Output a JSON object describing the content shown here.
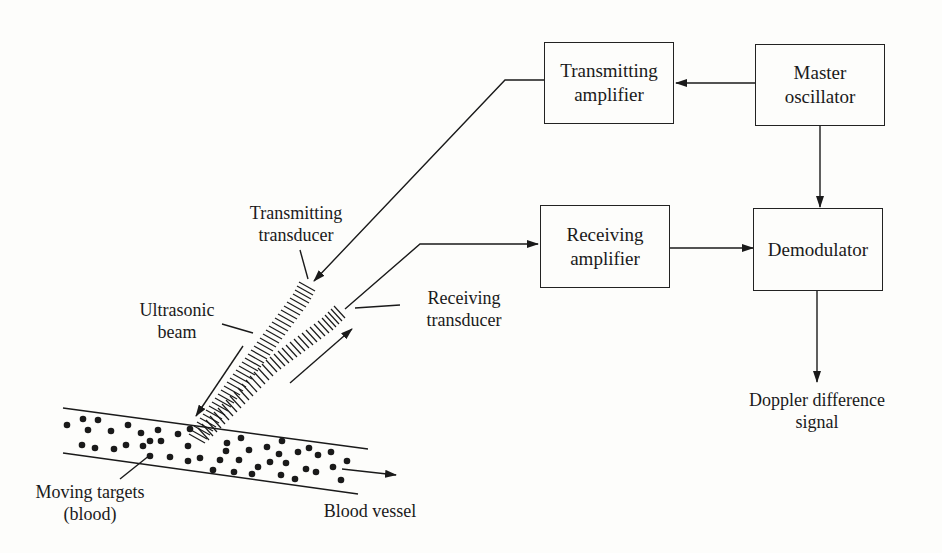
{
  "diagram": {
    "type": "block-diagram",
    "blocks": {
      "transmitting_amplifier": {
        "line1": "Transmitting",
        "line2": "amplifier"
      },
      "master_oscillator": {
        "line1": "Master",
        "line2": "oscillator"
      },
      "receiving_amplifier": {
        "line1": "Receiving",
        "line2": "amplifier"
      },
      "demodulator": {
        "line1": "Demodulator"
      }
    },
    "labels": {
      "transmitting_transducer": {
        "line1": "Transmitting",
        "line2": "transducer"
      },
      "receiving_transducer": {
        "line1": "Receiving",
        "line2": "transducer"
      },
      "ultrasonic_beam": {
        "line1": "Ultrasonic",
        "line2": "beam"
      },
      "moving_targets": {
        "line1": "Moving targets",
        "line2": "(blood)"
      },
      "blood_vessel": {
        "line1": "Blood vessel"
      },
      "output": {
        "line1": "Doppler difference",
        "line2": "signal"
      }
    },
    "connections": [
      {
        "from": "Master oscillator",
        "to": "Transmitting amplifier"
      },
      {
        "from": "Master oscillator",
        "to": "Demodulator"
      },
      {
        "from": "Transmitting amplifier",
        "to": "Transmitting transducer"
      },
      {
        "from": "Receiving transducer",
        "to": "Receiving amplifier"
      },
      {
        "from": "Receiving amplifier",
        "to": "Demodulator"
      },
      {
        "from": "Demodulator",
        "to": "Doppler difference signal"
      }
    ],
    "colors": {
      "ink": "#1a1a1a",
      "background": "#fdfdfb"
    }
  }
}
